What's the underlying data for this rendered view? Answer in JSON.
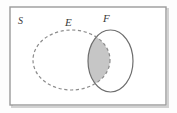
{
  "figure": {
    "type": "venn-diagram",
    "caption": "",
    "background_color": "#fdfdfd"
  },
  "universe": {
    "label": "S",
    "border_color": "#9a9a9a",
    "fill_color": "#ffffff",
    "shadow_color": "#c9c9c9"
  },
  "sets": [
    {
      "id": "E",
      "label": "E",
      "stroke_style": "dashed",
      "stroke_color": "#8c8c8c",
      "fill_color": "none",
      "label_x": 68,
      "label_y": 26
    },
    {
      "id": "F",
      "label": "F",
      "stroke_style": "solid",
      "stroke_color": "#6e6e6e",
      "fill_color": "none",
      "label_x": 106,
      "label_y": 22
    }
  ],
  "shaded_region": {
    "name": "E-intersect-F",
    "description": "intersection of E and F",
    "fill_color": "#c6c6c6"
  },
  "labels": {
    "universe": "S",
    "set_e": "E",
    "set_f": "F"
  }
}
